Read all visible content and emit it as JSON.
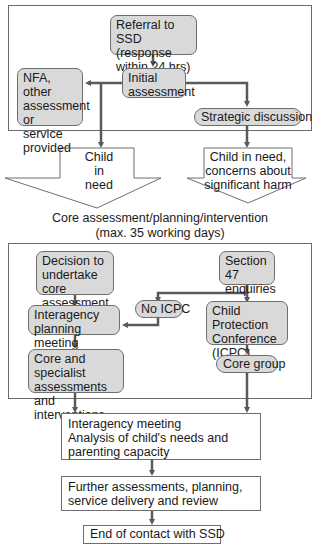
{
  "top_section": {
    "referral": "Referral to SSD (response within 24 hrs)",
    "initial": "Initial assessment",
    "nfa": "NFA, other assessment or service provided",
    "strategic": "Strategic discussion"
  },
  "outcomes": {
    "child_in_need": "Child in need",
    "harm": "Child in need, concerns about significant harm"
  },
  "core_caption": {
    "line1": "Core assessment/planning/intervention",
    "line2": "(max. 35 working days)"
  },
  "middle_section": {
    "decision": "Decision to undertake core assessment",
    "section47": "Section 47 enquiries",
    "no_icpc": "No ICPC",
    "planning": "Interagency planning meeting",
    "icpc": "Child Protection Conference (ICPC)",
    "core_specialist": "Core and specialist assessments and interventions",
    "core_group": "Core group"
  },
  "bottom_section": {
    "interagency_title": "Interagency meeting",
    "interagency_detail": "Analysis of child's needs and parenting capacity",
    "further": "Further assessments, planning, service delivery and review",
    "end": "End of contact with SSD"
  },
  "colors": {
    "box_fill": "#d9d9d9",
    "line": "#5a5a5a",
    "frame": "#6b6b6b"
  }
}
